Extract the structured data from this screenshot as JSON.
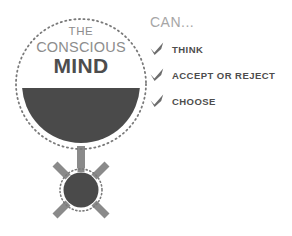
{
  "background_color": "#ffffff",
  "palette": {
    "fill_dark": "#4a4a4a",
    "ray_gray": "#8a8a8a",
    "dotted_ring": "#7a7a7a",
    "heading_gray": "#a6a6a6",
    "subtitle_gray": "#8d8d8d",
    "label_dark": "#4d4d4d"
  },
  "illustration": {
    "name": "conscious-mind-medallion",
    "bowl": {
      "label_line_1": "THE",
      "label_line_2": "CONSCIOUS",
      "label_line_3": "MIND",
      "fill_fraction": 0.5,
      "fill_color": "#4a4a4a",
      "ring_style": "dotted"
    },
    "sun": {
      "name": "sun-burst",
      "ray_count": 7,
      "ray_color": "#8a8a8a",
      "core_color": "#4a4a4a",
      "ring_style": "dotted"
    },
    "stem": {
      "color": "#8a8a8a"
    }
  },
  "capabilities": {
    "header": "CAN...",
    "items": [
      {
        "icon": "check-icon",
        "label": "THINK"
      },
      {
        "icon": "check-icon",
        "label": "ACCEPT OR REJECT"
      },
      {
        "icon": "check-icon",
        "label": "CHOOSE"
      }
    ]
  }
}
